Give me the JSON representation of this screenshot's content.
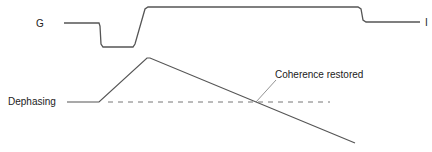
{
  "labels": {
    "gradient": "G",
    "gradient_end": "I",
    "dephasing": "Dephasing",
    "coherence": "Coherence restored"
  },
  "colors": {
    "line": "#555555",
    "dashed": "#777777",
    "text": "#222222"
  }
}
